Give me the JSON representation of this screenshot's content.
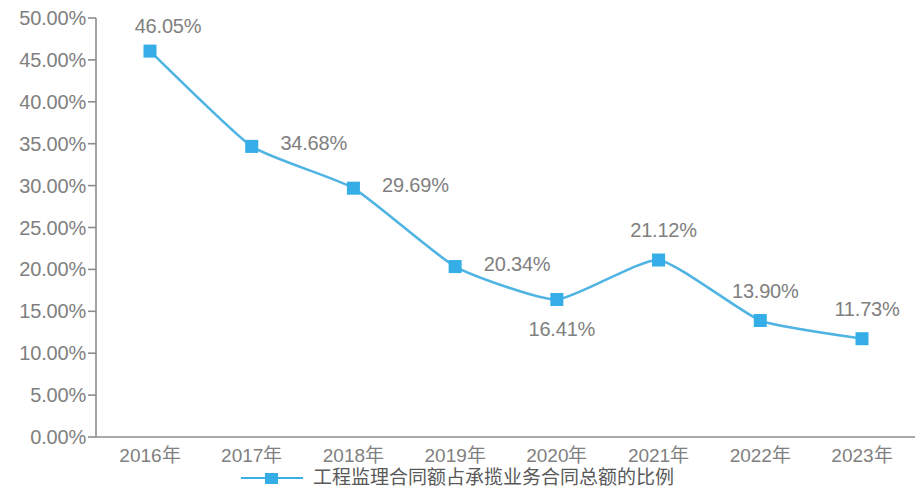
{
  "chart_data": {
    "type": "line",
    "title": "",
    "subtitle": "",
    "xlabel": "",
    "ylabel": "",
    "categories": [
      "2016年",
      "2017年",
      "2018年",
      "2019年",
      "2020年",
      "2021年",
      "2022年",
      "2023年"
    ],
    "values": [
      46.05,
      34.68,
      29.69,
      20.34,
      16.41,
      21.12,
      13.9,
      11.73
    ],
    "point_labels": [
      "46.05%",
      "34.68%",
      "29.69%",
      "20.34%",
      "16.41%",
      "21.12%",
      "13.90%",
      "11.73%"
    ],
    "series": [
      {
        "name": "工程监理合同额占承揽业务合同总额的比例",
        "values": [
          46.05,
          34.68,
          29.69,
          20.34,
          16.41,
          21.12,
          13.9,
          11.73
        ],
        "color": "#35AEE8",
        "marker": "square",
        "smooth": true
      }
    ],
    "ylim": [
      0,
      50
    ],
    "ytick_step": 5,
    "ytick_labels": [
      "50.00%",
      "45.00%",
      "40.00%",
      "35.00%",
      "30.00%",
      "25.00%",
      "20.00%",
      "15.00%",
      "10.00%",
      "5.00%",
      "0.00%"
    ],
    "ytick_values": [
      50,
      45,
      40,
      35,
      30,
      25,
      20,
      15,
      10,
      5,
      0
    ],
    "grid": false,
    "legend": {
      "position": "bottom-center",
      "entries": [
        {
          "label": "工程监理合同额占承揽业务合同总额的比例",
          "color": "#35AEE8",
          "marker": "square"
        }
      ]
    },
    "axis_color": "#808080",
    "label_color": "#808080",
    "background": "#ffffff"
  },
  "label_offsets": [
    {
      "dx": 18,
      "dy": -25
    },
    {
      "dx": 62,
      "dy": -3
    },
    {
      "dx": 62,
      "dy": -3
    },
    {
      "dx": 62,
      "dy": -3
    },
    {
      "dx": 5,
      "dy": 30
    },
    {
      "dx": 5,
      "dy": -30
    },
    {
      "dx": 5,
      "dy": -30
    },
    {
      "dx": 5,
      "dy": -30
    }
  ]
}
